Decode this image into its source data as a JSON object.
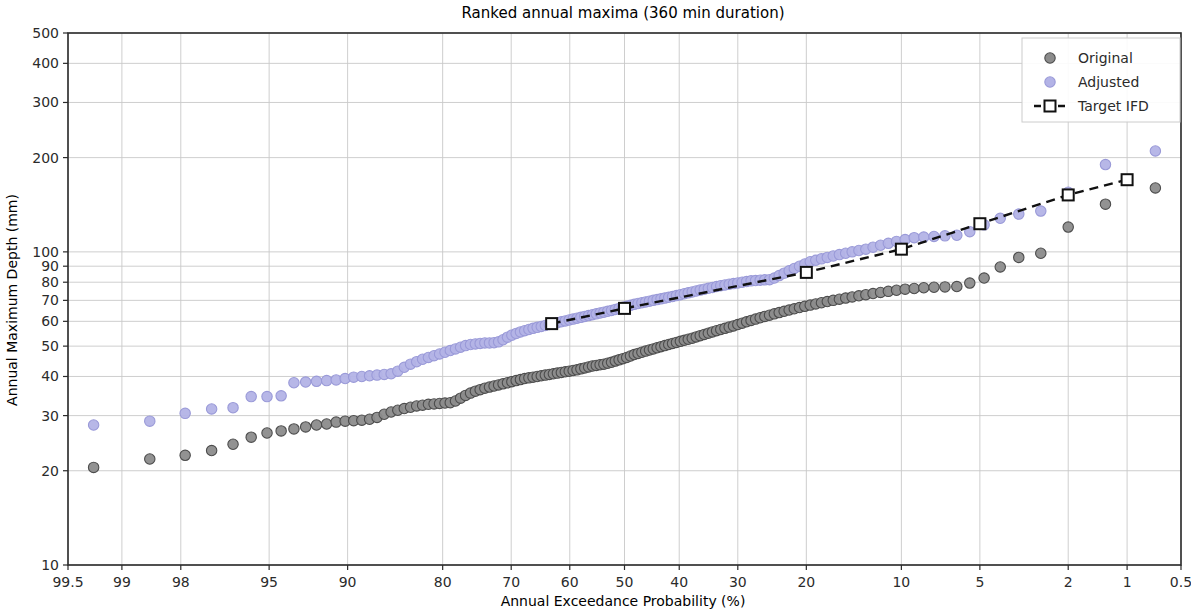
{
  "chart_data": {
    "type": "scatter",
    "title": "Ranked annual maxima (360 min duration)",
    "xlabel": "Annual Exceedance Probability (%)",
    "ylabel": "Annual Maximum Depth (mm)",
    "x_scale": "gumbel-probability-reversed",
    "y_scale": "log",
    "ylim": [
      10,
      500
    ],
    "xlim_aep_percent": [
      99.5,
      0.5
    ],
    "grid": true,
    "legend_position": "upper right",
    "x_ticks": [
      "99.5",
      "99",
      "98",
      "95",
      "90",
      "80",
      "70",
      "60",
      "50",
      "40",
      "30",
      "20",
      "10",
      "5",
      "2",
      "1",
      "0.5"
    ],
    "x_tick_values": [
      99.5,
      99,
      98,
      95,
      90,
      80,
      70,
      60,
      50,
      40,
      30,
      20,
      10,
      5,
      2,
      1,
      0.5
    ],
    "y_ticks": [
      "10",
      "20",
      "30",
      "40",
      "50",
      "60",
      "70",
      "80",
      "90",
      "100",
      "200",
      "300",
      "400",
      "500"
    ],
    "y_tick_values": [
      10,
      20,
      30,
      40,
      50,
      60,
      70,
      80,
      90,
      100,
      200,
      300,
      400,
      500
    ],
    "colors": {
      "original": "#8c8c8c",
      "original_edge": "#4d4d4d",
      "adjusted": "#b3b3e6",
      "adjusted_edge": "#9a9ad8",
      "target": "#111111",
      "grid": "#c8c8c8",
      "axis": "#2b2b2b"
    },
    "series": [
      {
        "name": "Original",
        "marker": "circle",
        "aep_percent": [
          99.3,
          98.6,
          97.9,
          97.2,
          96.5,
          95.8,
          95.1,
          94.4,
          93.7,
          93.0,
          92.3,
          91.6,
          90.9,
          90.2,
          89.5,
          88.8,
          88.1,
          87.4,
          86.7,
          86.0,
          85.3,
          84.6,
          83.9,
          83.2,
          82.5,
          81.8,
          81.1,
          80.4,
          79.7,
          79.0,
          78.3,
          77.6,
          76.9,
          76.2,
          75.5,
          74.8,
          74.1,
          73.4,
          72.7,
          72.0,
          71.3,
          70.6,
          69.9,
          69.2,
          68.5,
          67.8,
          67.1,
          66.4,
          65.7,
          65.0,
          64.3,
          63.6,
          62.9,
          62.2,
          61.5,
          60.8,
          60.1,
          59.4,
          58.7,
          58.0,
          57.3,
          56.6,
          55.9,
          55.2,
          54.5,
          53.8,
          53.1,
          52.4,
          51.7,
          51.0,
          50.3,
          49.6,
          48.9,
          48.2,
          47.5,
          46.8,
          46.1,
          45.4,
          44.7,
          44.0,
          43.3,
          42.6,
          41.9,
          41.2,
          40.5,
          39.8,
          39.1,
          38.4,
          37.7,
          37.0,
          36.3,
          35.6,
          34.9,
          34.2,
          33.5,
          32.8,
          32.1,
          31.4,
          30.7,
          30.0,
          29.3,
          28.6,
          27.9,
          27.2,
          26.5,
          25.8,
          25.1,
          24.4,
          23.7,
          23.0,
          22.3,
          21.6,
          20.9,
          20.2,
          19.5,
          18.8,
          18.1,
          17.4,
          16.7,
          16.0,
          15.3,
          14.6,
          13.9,
          13.2,
          12.5,
          11.8,
          11.1,
          10.4,
          9.7,
          9.0,
          8.3,
          7.6,
          6.9,
          6.2,
          5.5,
          4.8,
          4.1,
          3.4,
          2.7,
          2.0,
          1.3,
          0.7
        ],
        "depth_mm": [
          20.5,
          21.8,
          22.4,
          23.2,
          24.3,
          25.6,
          26.4,
          26.8,
          27.2,
          27.6,
          28.0,
          28.2,
          28.6,
          28.8,
          28.9,
          29.0,
          29.2,
          29.6,
          30.3,
          30.8,
          31.2,
          31.6,
          31.9,
          32.2,
          32.4,
          32.6,
          32.7,
          32.8,
          32.9,
          33.0,
          33.4,
          34.1,
          34.8,
          35.4,
          35.9,
          36.3,
          36.7,
          37.0,
          37.3,
          37.6,
          37.9,
          38.2,
          38.5,
          38.8,
          39.1,
          39.4,
          39.6,
          39.8,
          40.0,
          40.2,
          40.4,
          40.6,
          40.8,
          41.0,
          41.2,
          41.4,
          41.6,
          41.8,
          42.0,
          42.3,
          42.6,
          42.9,
          43.2,
          43.4,
          43.6,
          43.8,
          44.1,
          44.4,
          44.8,
          45.2,
          45.6,
          46.0,
          46.5,
          47.0,
          47.4,
          47.8,
          48.2,
          48.6,
          49.0,
          49.4,
          49.8,
          50.2,
          50.6,
          51.0,
          51.4,
          51.8,
          52.2,
          52.6,
          53.0,
          53.5,
          54.0,
          54.5,
          55.0,
          55.5,
          56.0,
          56.5,
          57.0,
          57.5,
          58.0,
          58.6,
          59.2,
          59.8,
          60.4,
          61.0,
          61.6,
          62.2,
          62.8,
          63.4,
          64.0,
          64.6,
          65.2,
          65.8,
          66.4,
          67.0,
          67.6,
          68.2,
          68.8,
          69.4,
          70.0,
          70.6,
          71.2,
          71.8,
          72.4,
          73.0,
          73.6,
          74.2,
          74.8,
          75.4,
          76.0,
          76.4,
          76.8,
          77.1,
          77.3,
          77.5,
          79.5,
          82.5,
          89.5,
          96.0,
          99.0,
          120.0,
          142.0,
          160.0
        ]
      },
      {
        "name": "Adjusted",
        "marker": "circle",
        "aep_percent": [
          99.3,
          98.6,
          97.9,
          97.2,
          96.5,
          95.8,
          95.1,
          94.4,
          93.7,
          93.0,
          92.3,
          91.6,
          90.9,
          90.2,
          89.5,
          88.8,
          88.1,
          87.4,
          86.7,
          86.0,
          85.3,
          84.6,
          83.9,
          83.2,
          82.5,
          81.8,
          81.1,
          80.4,
          79.7,
          79.0,
          78.3,
          77.6,
          76.9,
          76.2,
          75.5,
          74.8,
          74.1,
          73.4,
          72.7,
          72.0,
          71.3,
          70.6,
          69.9,
          69.2,
          68.5,
          67.8,
          67.1,
          66.4,
          65.7,
          65.0,
          64.3,
          63.6,
          62.9,
          62.2,
          61.5,
          60.8,
          60.1,
          59.4,
          58.7,
          58.0,
          57.3,
          56.6,
          55.9,
          55.2,
          54.5,
          53.8,
          53.1,
          52.4,
          51.7,
          51.0,
          50.3,
          49.6,
          48.9,
          48.2,
          47.5,
          46.8,
          46.1,
          45.4,
          44.7,
          44.0,
          43.3,
          42.6,
          41.9,
          41.2,
          40.5,
          39.8,
          39.1,
          38.4,
          37.7,
          37.0,
          36.3,
          35.6,
          34.9,
          34.2,
          33.5,
          32.8,
          32.1,
          31.4,
          30.7,
          30.0,
          29.3,
          28.6,
          27.9,
          27.2,
          26.5,
          25.8,
          25.1,
          24.4,
          23.7,
          23.0,
          22.3,
          21.6,
          20.9,
          20.2,
          19.5,
          18.8,
          18.1,
          17.4,
          16.7,
          16.0,
          15.3,
          14.6,
          13.9,
          13.2,
          12.5,
          11.8,
          11.1,
          10.4,
          9.7,
          9.0,
          8.3,
          7.6,
          6.9,
          6.2,
          5.5,
          4.8,
          4.1,
          3.4,
          2.7,
          2.0,
          1.3,
          0.7
        ],
        "depth_mm": [
          28.0,
          28.8,
          30.5,
          31.5,
          31.8,
          34.5,
          34.5,
          34.7,
          38.2,
          38.4,
          38.6,
          38.8,
          39.0,
          39.4,
          39.8,
          40.0,
          40.2,
          40.4,
          40.6,
          40.8,
          41.6,
          42.8,
          43.8,
          44.6,
          45.4,
          46.0,
          46.6,
          47.2,
          47.8,
          48.4,
          49.0,
          49.6,
          50.2,
          50.6,
          50.8,
          51.0,
          51.2,
          51.2,
          51.3,
          51.6,
          52.4,
          53.4,
          54.2,
          54.9,
          55.5,
          56.0,
          56.5,
          57.0,
          57.4,
          57.8,
          58.2,
          58.6,
          59.0,
          59.4,
          59.8,
          60.2,
          60.6,
          61.0,
          61.4,
          61.8,
          62.2,
          62.6,
          63.0,
          63.4,
          63.8,
          64.2,
          64.6,
          65.0,
          65.5,
          66.0,
          66.5,
          67.0,
          67.5,
          68.0,
          68.4,
          68.8,
          69.2,
          69.6,
          70.0,
          70.4,
          70.8,
          71.2,
          71.6,
          72.0,
          72.5,
          73.0,
          73.5,
          74.0,
          74.5,
          75.0,
          75.5,
          76.0,
          76.5,
          77.0,
          77.5,
          78.0,
          78.4,
          78.8,
          79.2,
          79.6,
          80.0,
          80.4,
          80.8,
          81.0,
          81.2,
          81.4,
          81.5,
          82.5,
          84.0,
          85.5,
          87.0,
          88.5,
          90.0,
          91.5,
          93.0,
          94.0,
          95.0,
          96.0,
          97.0,
          98.0,
          99.0,
          100.0,
          101.0,
          102.0,
          103.5,
          105.0,
          106.5,
          108.0,
          109.5,
          111.0,
          111.5,
          112.0,
          112.5,
          113.0,
          116.0,
          122.0,
          128.0,
          132.0,
          135.0,
          155.0,
          190.0,
          210.0
        ]
      }
    ],
    "target_ifd": {
      "name": "Target IFD",
      "marker": "square",
      "linestyle": "dashed",
      "aep_percent": [
        63.2,
        50,
        20,
        10,
        5,
        2,
        1
      ],
      "depth_mm": [
        59,
        66,
        86,
        102,
        123,
        152,
        170
      ]
    }
  },
  "legend": {
    "items": [
      {
        "label": "Original",
        "type": "circle"
      },
      {
        "label": "Adjusted",
        "type": "circle"
      },
      {
        "label": "Target IFD",
        "type": "line-square"
      }
    ]
  }
}
